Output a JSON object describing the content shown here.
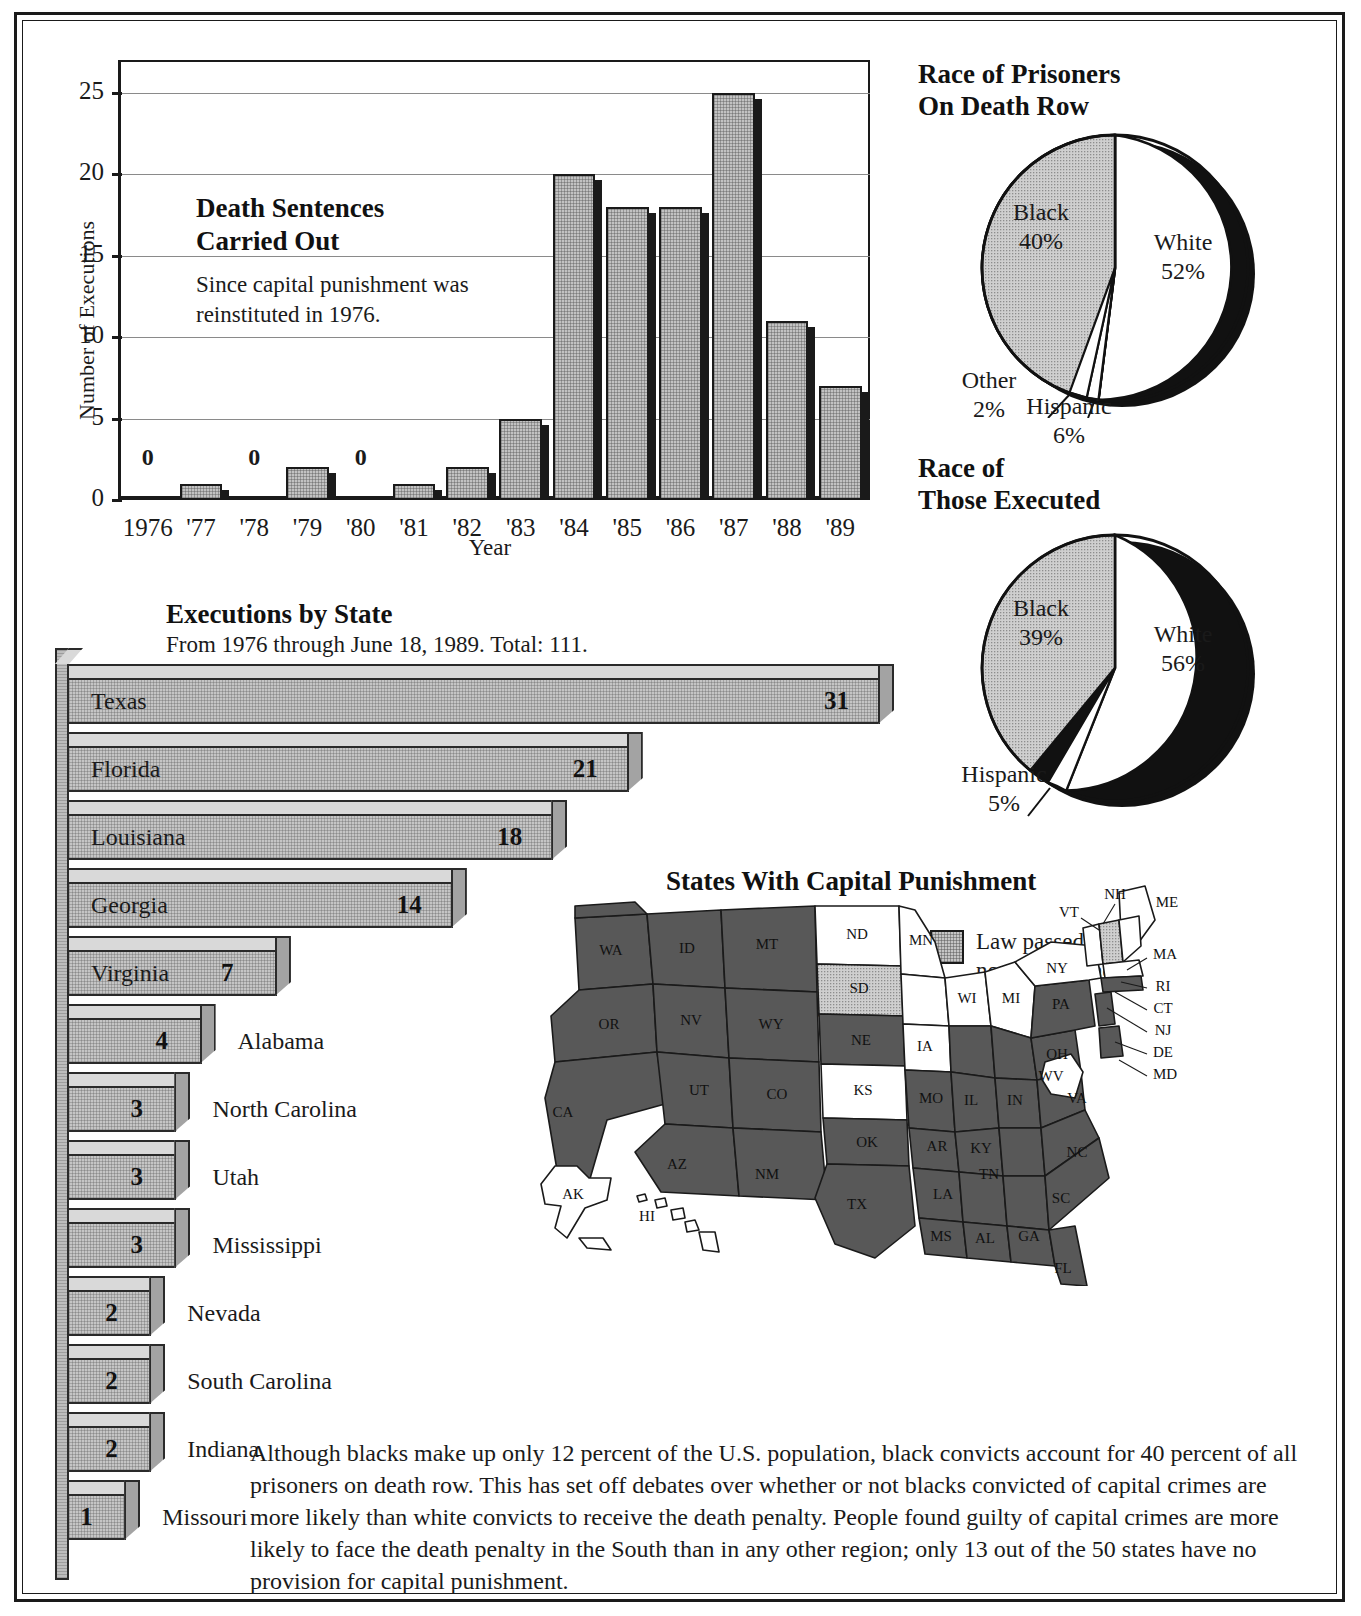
{
  "chart_data": [
    {
      "type": "bar",
      "title": "Death Sentences Carried Out",
      "subtitle": "Since capital punishment was reinstituted in 1976.",
      "xlabel": "Year",
      "ylabel": "Number of Executions",
      "categories": [
        "1976",
        "'77",
        "'78",
        "'79",
        "'80",
        "'81",
        "'82",
        "'83",
        "'84",
        "'85",
        "'86",
        "'87",
        "'88",
        "'89"
      ],
      "values": [
        0,
        1,
        0,
        2,
        0,
        1,
        2,
        5,
        20,
        18,
        18,
        25,
        11,
        7
      ],
      "zero_labels": [
        "0",
        "0",
        "0"
      ],
      "ylim": [
        0,
        27
      ],
      "yticks": [
        0,
        5,
        10,
        15,
        20,
        25
      ],
      "grid": true,
      "legend": "none"
    },
    {
      "type": "pie",
      "title": "Race of Prisoners On Death Row",
      "title_lines": [
        "Race of Prisoners",
        "On Death Row"
      ],
      "labels": [
        "White",
        "Black",
        "Hispanic",
        "Other"
      ],
      "values": [
        52,
        40,
        6,
        2
      ],
      "value_labels": [
        "52%",
        "40%",
        "6%",
        "2%"
      ],
      "legend": "on-slice"
    },
    {
      "type": "pie",
      "title": "Race of Those Executed",
      "title_lines": [
        "Race of",
        "Those Executed"
      ],
      "labels": [
        "White",
        "Black",
        "Hispanic"
      ],
      "values": [
        56,
        39,
        5
      ],
      "value_labels": [
        "56%",
        "39%",
        "5%"
      ],
      "legend": "on-slice"
    },
    {
      "type": "bar",
      "orientation": "horizontal",
      "title": "Executions by State",
      "subtitle": "From 1976 through June 18, 1989. Total: 111.",
      "categories": [
        "Texas",
        "Florida",
        "Louisiana",
        "Georgia",
        "Virginia",
        "Alabama",
        "North Carolina",
        "Utah",
        "Mississippi",
        "Nevada",
        "South Carolina",
        "Indiana",
        "Missouri"
      ],
      "values": [
        31,
        21,
        18,
        14,
        7,
        4,
        3,
        3,
        3,
        2,
        2,
        2,
        1
      ],
      "xlabel": "",
      "ylabel": ""
    }
  ],
  "bar_chart": {
    "title_line1": "Death Sentences",
    "title_line2": "Carried Out",
    "sub_line1": "Since capital punishment was",
    "sub_line2": "reinstituted in 1976.",
    "y_axis_title": "Number of Executions",
    "x_axis_title": "Year",
    "y_ticks": [
      "25",
      "20",
      "15",
      "10",
      "5",
      "0"
    ],
    "bars": [
      {
        "year": "1976",
        "value": 0,
        "label": "0"
      },
      {
        "year": "'77",
        "value": 1,
        "label": ""
      },
      {
        "year": "'78",
        "value": 0,
        "label": "0"
      },
      {
        "year": "'79",
        "value": 2,
        "label": ""
      },
      {
        "year": "'80",
        "value": 0,
        "label": "0"
      },
      {
        "year": "'81",
        "value": 1,
        "label": ""
      },
      {
        "year": "'82",
        "value": 2,
        "label": ""
      },
      {
        "year": "'83",
        "value": 5,
        "label": ""
      },
      {
        "year": "'84",
        "value": 20,
        "label": ""
      },
      {
        "year": "'85",
        "value": 18,
        "label": ""
      },
      {
        "year": "'86",
        "value": 18,
        "label": ""
      },
      {
        "year": "'87",
        "value": 25,
        "label": ""
      },
      {
        "year": "'88",
        "value": 11,
        "label": ""
      },
      {
        "year": "'89",
        "value": 7,
        "label": ""
      }
    ]
  },
  "pie_death_row": {
    "title_line1": "Race of Prisoners",
    "title_line2": "On Death Row",
    "white_name": "White",
    "white_pct": "52%",
    "black_name": "Black",
    "black_pct": "40%",
    "hispanic_name": "Hispanic",
    "hispanic_pct": "6%",
    "other_name": "Other",
    "other_pct": "2%"
  },
  "pie_executed": {
    "title_line1": "Race of",
    "title_line2": "Those Executed",
    "white_name": "White",
    "white_pct": "56%",
    "black_name": "Black",
    "black_pct": "39%",
    "hispanic_name": "Hispanic",
    "hispanic_pct": "5%"
  },
  "state_bars": {
    "title": "Executions by State",
    "subtitle": "From 1976 through June 18, 1989. Total: 111.",
    "rows": [
      {
        "name": "Texas",
        "value": "31",
        "label_inside": true
      },
      {
        "name": "Florida",
        "value": "21",
        "label_inside": true
      },
      {
        "name": "Louisiana",
        "value": "18",
        "label_inside": true
      },
      {
        "name": "Georgia",
        "value": "14",
        "label_inside": true
      },
      {
        "name": "Virginia",
        "value": "7",
        "label_inside": true
      },
      {
        "name": "Alabama",
        "value": "4",
        "label_inside": false
      },
      {
        "name": "North Carolina",
        "value": "3",
        "label_inside": false
      },
      {
        "name": "Utah",
        "value": "3",
        "label_inside": false
      },
      {
        "name": "Mississippi",
        "value": "3",
        "label_inside": false
      },
      {
        "name": "Nevada",
        "value": "2",
        "label_inside": false
      },
      {
        "name": "South Carolina",
        "value": "2",
        "label_inside": false
      },
      {
        "name": "Indiana",
        "value": "2",
        "label_inside": false
      },
      {
        "name": "Missouri",
        "value": "1",
        "label_inside": false
      }
    ]
  },
  "map": {
    "title": "States With Capital Punishment",
    "legend": [
      {
        "key": "implemented",
        "line1": "Capital punishment",
        "line2": "law implemented",
        "color": "#585858"
      },
      {
        "key": "law-passed",
        "line1": "Law passed, but",
        "line2": "no one sentenced",
        "color": "#c5c5c5"
      },
      {
        "key": "none",
        "line1": "No capital punishment",
        "line2": "",
        "color": "#ffffff"
      }
    ],
    "states": [
      {
        "abbr": "WA",
        "status": "implemented"
      },
      {
        "abbr": "OR",
        "status": "implemented"
      },
      {
        "abbr": "CA",
        "status": "implemented"
      },
      {
        "abbr": "NV",
        "status": "implemented"
      },
      {
        "abbr": "ID",
        "status": "implemented"
      },
      {
        "abbr": "MT",
        "status": "implemented"
      },
      {
        "abbr": "WY",
        "status": "implemented"
      },
      {
        "abbr": "UT",
        "status": "implemented"
      },
      {
        "abbr": "AZ",
        "status": "implemented"
      },
      {
        "abbr": "CO",
        "status": "implemented"
      },
      {
        "abbr": "NM",
        "status": "implemented"
      },
      {
        "abbr": "ND",
        "status": "none"
      },
      {
        "abbr": "SD",
        "status": "law-passed"
      },
      {
        "abbr": "NE",
        "status": "implemented"
      },
      {
        "abbr": "KS",
        "status": "law-passed"
      },
      {
        "abbr": "OK",
        "status": "implemented"
      },
      {
        "abbr": "TX",
        "status": "implemented"
      },
      {
        "abbr": "MN",
        "status": "none"
      },
      {
        "abbr": "IA",
        "status": "none"
      },
      {
        "abbr": "MO",
        "status": "implemented"
      },
      {
        "abbr": "AR",
        "status": "implemented"
      },
      {
        "abbr": "LA",
        "status": "implemented"
      },
      {
        "abbr": "WI",
        "status": "none"
      },
      {
        "abbr": "IL",
        "status": "implemented"
      },
      {
        "abbr": "MI",
        "status": "none"
      },
      {
        "abbr": "IN",
        "status": "implemented"
      },
      {
        "abbr": "OH",
        "status": "implemented"
      },
      {
        "abbr": "KY",
        "status": "implemented"
      },
      {
        "abbr": "TN",
        "status": "implemented"
      },
      {
        "abbr": "MS",
        "status": "implemented"
      },
      {
        "abbr": "AL",
        "status": "implemented"
      },
      {
        "abbr": "GA",
        "status": "implemented"
      },
      {
        "abbr": "FL",
        "status": "implemented"
      },
      {
        "abbr": "SC",
        "status": "implemented"
      },
      {
        "abbr": "NC",
        "status": "implemented"
      },
      {
        "abbr": "VA",
        "status": "implemented"
      },
      {
        "abbr": "WV",
        "status": "none"
      },
      {
        "abbr": "PA",
        "status": "implemented"
      },
      {
        "abbr": "NY",
        "status": "none"
      },
      {
        "abbr": "VT",
        "status": "none"
      },
      {
        "abbr": "NH",
        "status": "law-passed"
      },
      {
        "abbr": "ME",
        "status": "none"
      },
      {
        "abbr": "MA",
        "status": "none"
      },
      {
        "abbr": "RI",
        "status": "none"
      },
      {
        "abbr": "CT",
        "status": "implemented"
      },
      {
        "abbr": "NJ",
        "status": "implemented"
      },
      {
        "abbr": "DE",
        "status": "implemented"
      },
      {
        "abbr": "MD",
        "status": "implemented"
      },
      {
        "abbr": "AK",
        "status": "none"
      },
      {
        "abbr": "HI",
        "status": "none"
      }
    ]
  },
  "blurb": {
    "text": "Although blacks make up only 12 percent of the U.S. population, black convicts account for 40 percent of all prisoners on death row. This has set off debates over whether or not blacks convicted of capital crimes are more likely than white convicts to receive the death penalty. People found guilty of capital crimes are more likely to face the death penalty in the South than in any other region; only 13 out of the 50 states have no provision for capital punishment."
  }
}
